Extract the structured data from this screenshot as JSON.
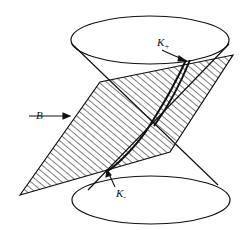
{
  "diagram": {
    "labels": {
      "plane": "B",
      "upper_curve_main": "K",
      "upper_curve_sub": "+",
      "lower_curve_main": "K",
      "lower_curve_sub": "-"
    },
    "colors": {
      "stroke": "#111111",
      "background": "#ffffff"
    }
  }
}
